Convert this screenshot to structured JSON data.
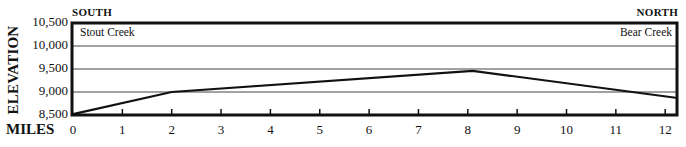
{
  "chart_data": {
    "type": "line",
    "title": "",
    "xlabel": "MILES",
    "ylabel": "ELEVATION",
    "xlim": [
      0,
      12.25
    ],
    "ylim": [
      8500,
      10500
    ],
    "x_ticks": [
      0,
      1,
      2,
      3,
      4,
      5,
      6,
      7,
      8,
      9,
      10,
      11,
      12
    ],
    "y_ticks": [
      8500,
      9000,
      9500,
      10000,
      10500
    ],
    "y_tick_labels": [
      "8,500",
      "9,000",
      "9,500",
      "10,000",
      "10,500"
    ],
    "grid": "horizontal",
    "series": [
      {
        "name": "Trail profile",
        "x": [
          0,
          2,
          8.1,
          12.25
        ],
        "y": [
          8520,
          9000,
          9460,
          8870
        ]
      }
    ],
    "annotations": {
      "start_direction": "SOUTH",
      "end_direction": "NORTH",
      "start_place": "Stout Creek",
      "end_place": "Bear Creek"
    }
  },
  "labels": {
    "south": "SOUTH",
    "north": "NORTH",
    "elevation": "ELEVATION",
    "miles": "MILES",
    "start_place": "Stout Creek",
    "end_place": "Bear Creek"
  },
  "colors": {
    "line": "#111111",
    "frame": "#111111",
    "grid": "#444444"
  }
}
